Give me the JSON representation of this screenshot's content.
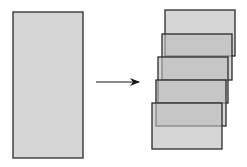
{
  "diagram": {
    "colors": {
      "background": "#ffffff",
      "fill": "#c8c8c8",
      "stroke": "#2a2a2a",
      "arrow": "#1a1a1a"
    },
    "source_rect": {
      "x": 13,
      "y": 12,
      "width": 70,
      "height": 146
    },
    "arrow": {
      "x1": 96,
      "y1": 82,
      "x2": 139,
      "y2": 82
    },
    "stacked_rects": [
      {
        "x": 165,
        "y": 10,
        "width": 70,
        "height": 46
      },
      {
        "x": 162,
        "y": 34,
        "width": 70,
        "height": 46
      },
      {
        "x": 158,
        "y": 57,
        "width": 70,
        "height": 46
      },
      {
        "x": 156,
        "y": 80,
        "width": 70,
        "height": 46
      },
      {
        "x": 152,
        "y": 103,
        "width": 70,
        "height": 46
      }
    ]
  }
}
